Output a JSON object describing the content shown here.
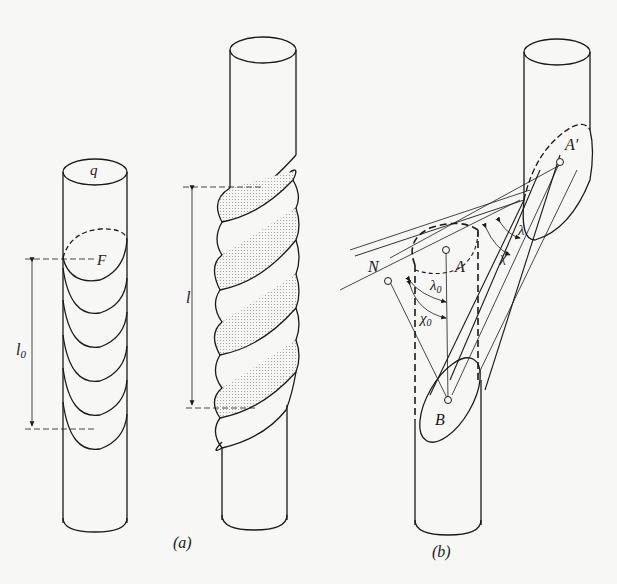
{
  "figure": {
    "panel_a": {
      "caption": "(a)",
      "left_rod": {
        "cross_section_label": "q",
        "slip_plane_label": "F",
        "length_label": "l",
        "length_subscript": "0",
        "slip_bands": 5
      },
      "right_rod": {
        "length_label": "l",
        "sheared_segments": 7
      }
    },
    "panel_b": {
      "caption": "(b)",
      "labels": {
        "normal_point": "N",
        "point_a": "A",
        "point_a_prime": "A′",
        "point_b": "B",
        "lambda0": "λ",
        "lambda0_sub": "0",
        "chi0": "χ",
        "chi0_sub": "0",
        "lambda": "λ",
        "chi": "χ"
      }
    }
  },
  "colors": {
    "ink": "#1a1a1a",
    "background": "#f7f7f5",
    "shade": "#d8d8d4"
  }
}
